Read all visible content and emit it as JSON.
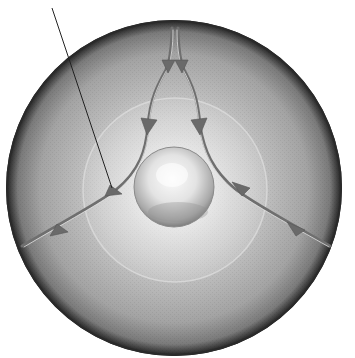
{
  "diagram": {
    "type": "schematic",
    "disk": {
      "cx": 174,
      "cy": 188,
      "r": 168,
      "rim_color": "#2a2a2a",
      "fill_color": "#a9a9a9"
    },
    "inner_glow": {
      "cx": 175,
      "cy": 190,
      "r": 92,
      "color": "#e6e6e6"
    },
    "sphere": {
      "cx": 174,
      "cy": 187,
      "r": 40,
      "highlight": "#f4f4f4",
      "shadow": "#8a8a8a"
    },
    "flow_color": "#6f6f6f",
    "flow_paths": [
      {
        "name": "top-left-branch",
        "points": "M174,28 C172,60 166,62 158,70 C150,85 148,100 148,128 C146,150 140,170 116,190 C95,205 70,215 24,246"
      },
      {
        "name": "top-right-branch",
        "points": "M176,28 C178,60 184,62 192,70 C198,85 198,100 200,128 C204,150 212,170 234,190 C255,205 285,220 330,246"
      }
    ],
    "arrowheads": [
      {
        "name": "arrow-top-left",
        "x": 168,
        "y": 68,
        "angle": 90
      },
      {
        "name": "arrow-top-right",
        "x": 182,
        "y": 68,
        "angle": 90
      },
      {
        "name": "arrow-mid-left",
        "x": 148,
        "y": 126,
        "angle": 95
      },
      {
        "name": "arrow-mid-right",
        "x": 198,
        "y": 126,
        "angle": 85
      },
      {
        "name": "arrow-lower-left-inner",
        "x": 114,
        "y": 192,
        "angle": 145
      },
      {
        "name": "arrow-lower-right-inner",
        "x": 238,
        "y": 192,
        "angle": 35
      },
      {
        "name": "arrow-lower-left-outer",
        "x": 58,
        "y": 230,
        "angle": 150
      },
      {
        "name": "arrow-lower-right-outer",
        "x": 294,
        "y": 230,
        "angle": 30
      }
    ],
    "leader_line": {
      "x1": 52,
      "y1": 8,
      "x2": 112,
      "y2": 188,
      "color": "#222222"
    }
  }
}
